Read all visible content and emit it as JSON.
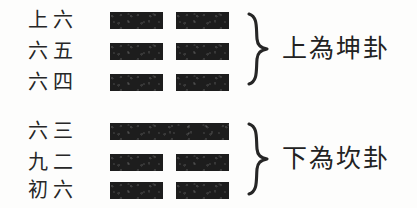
{
  "diagram": {
    "background_color": "#fdfdfc",
    "ink_color": "#1d1d1d",
    "groups": [
      {
        "id": "upper-trigram",
        "position": "upper",
        "caption": "上為坤卦",
        "brace": "right-curly-brace",
        "lines": [
          {
            "label": "上六",
            "type": "yin",
            "name": "broken-line"
          },
          {
            "label": "六五",
            "type": "yin",
            "name": "broken-line"
          },
          {
            "label": "六四",
            "type": "yin",
            "name": "broken-line"
          }
        ]
      },
      {
        "id": "lower-trigram",
        "position": "lower",
        "caption": "下為坎卦",
        "brace": "right-curly-brace",
        "lines": [
          {
            "label": "六三",
            "type": "yin",
            "name": "broken-line"
          },
          {
            "label": "九二",
            "type": "yang",
            "name": "solid-line"
          },
          {
            "label": "初六",
            "type": "yin",
            "name": "broken-line"
          }
        ]
      }
    ]
  }
}
